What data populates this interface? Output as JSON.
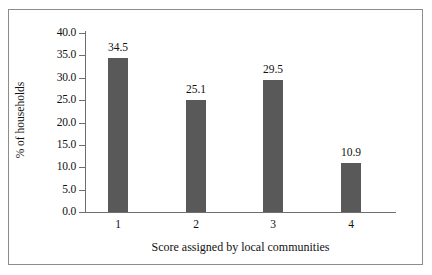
{
  "chart_data": {
    "type": "bar",
    "title": "",
    "subtitle": "",
    "xlabel": "Score assigned by local communities",
    "ylabel": "% of households",
    "categories": [
      "1",
      "2",
      "3",
      "4"
    ],
    "values": [
      34.5,
      25.1,
      29.5,
      10.9
    ],
    "data_labels": [
      "34.5",
      "25.1",
      "29.5",
      "10.9"
    ],
    "ylim": [
      0.0,
      40.0
    ],
    "ytick_labels": [
      "40.0",
      "35.0",
      "30.0",
      "25.0",
      "20.0",
      "15.0",
      "10.0",
      "5.0",
      "0.0"
    ],
    "ytick_values": [
      40.0,
      35.0,
      30.0,
      25.0,
      20.0,
      15.0,
      10.0,
      5.0,
      0.0
    ],
    "ytick_step": 5.0,
    "grid": false,
    "legend": false,
    "legend_position": "none",
    "bar_color": "#595959",
    "axis_color": "#6e6e6e",
    "frame_color": "#8c8c8c",
    "background_color": "#ffffff",
    "text_color": "#111111"
  }
}
